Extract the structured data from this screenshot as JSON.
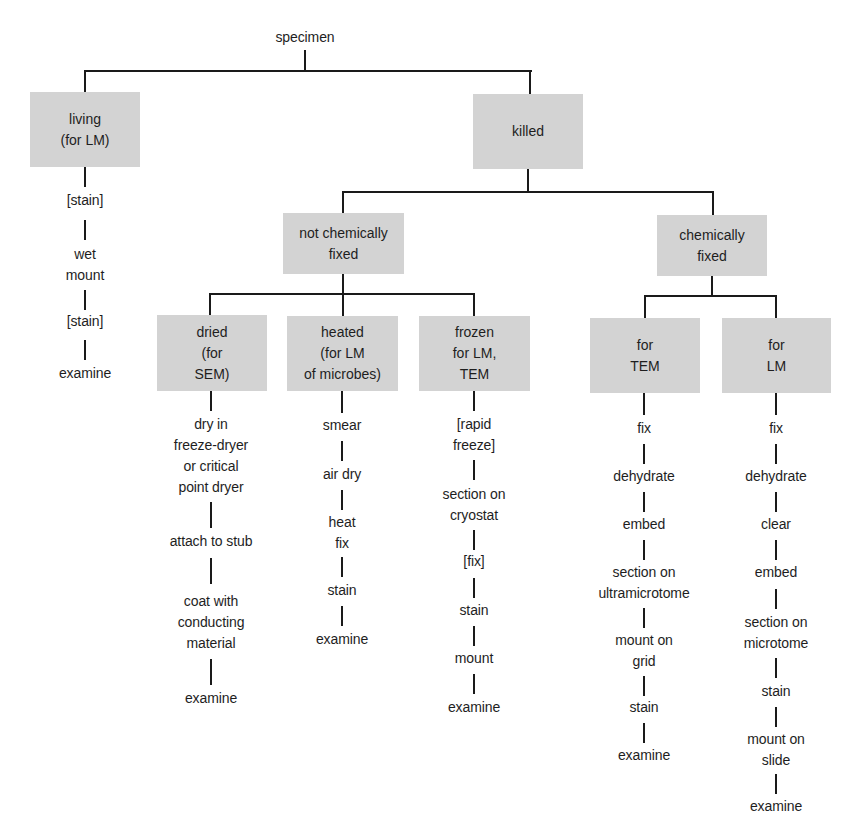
{
  "diagram": {
    "root": "specimen",
    "living": {
      "label": "living\n(for LM)",
      "steps": [
        "[stain]",
        "wet\nmount",
        "[stain]",
        "examine"
      ]
    },
    "killed": {
      "label": "killed",
      "not_chemically_fixed": {
        "label": "not chemically\nfixed",
        "dried": {
          "label": "dried\n(for\nSEM)",
          "steps": [
            "dry in\nfreeze-dryer\nor critical\npoint dryer",
            "attach to stub",
            "coat with\nconducting\nmaterial",
            "examine"
          ]
        },
        "heated": {
          "label": "heated\n(for LM\nof microbes)",
          "steps": [
            "smear",
            "air dry",
            "heat\nfix",
            "stain",
            "examine"
          ]
        },
        "frozen": {
          "label": "frozen\nfor LM,\nTEM",
          "steps": [
            "[rapid\nfreeze]",
            "section on\ncryostat",
            "[fix]",
            "stain",
            "mount",
            "examine"
          ]
        }
      },
      "chemically_fixed": {
        "label": "chemically\nfixed",
        "for_tem": {
          "label": "for\nTEM",
          "steps": [
            "fix",
            "dehydrate",
            "embed",
            "section on\nultramicrotome",
            "mount on\ngrid",
            "stain",
            "examine"
          ]
        },
        "for_lm": {
          "label": "for\nLM",
          "steps": [
            "fix",
            "dehydrate",
            "clear",
            "embed",
            "section on\nmicrotome",
            "stain",
            "mount on\nslide",
            "examine"
          ]
        }
      }
    },
    "colors": {
      "box_fill": "#d3d3d3",
      "line": "#1a1a1a",
      "text": "#1e1e1e"
    }
  }
}
